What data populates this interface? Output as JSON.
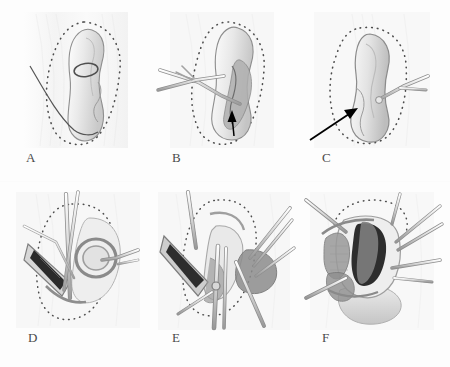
{
  "figure": {
    "type": "surgical-illustration",
    "columns": 3,
    "rows": 2,
    "background_color": "#fdfdfd",
    "line_color": "#5a5a5a",
    "dotted_outline_color": "#4d4d4d",
    "dark_tissue_color": "#1c1c1c",
    "mid_tissue_color": "#8d8d8d",
    "light_tissue_color": "#d6d6d6",
    "arrow_color": "#000000",
    "label_color": "#4a4a4a"
  },
  "panels": [
    {
      "id": "A",
      "label": "A",
      "label_x": 26,
      "label_y": 158,
      "caption": "Organ in situ with dotted resection outline and single suture thread",
      "features": [
        "dotted-outline",
        "organ-body",
        "suture-thread",
        "ligature-loop"
      ],
      "instrument_count": 0,
      "arrow": false
    },
    {
      "id": "B",
      "label": "B",
      "label_x": 172,
      "label_y": 158,
      "caption": "Forceps and scissors introduced; black arrow marks dissection point",
      "features": [
        "dotted-outline",
        "organ-body",
        "forceps",
        "scissors",
        "shaded-hilum"
      ],
      "instrument_count": 2,
      "arrow": true,
      "arrow_direction": "up"
    },
    {
      "id": "C",
      "label": "C",
      "label_x": 322,
      "label_y": 158,
      "caption": "Mobilized organ retracted; long arrow indicates plane of exposure",
      "features": [
        "dotted-outline",
        "organ-body",
        "retractor",
        "long-arrow"
      ],
      "instrument_count": 1,
      "arrow": true,
      "arrow_direction": "up-right"
    },
    {
      "id": "D",
      "label": "D",
      "label_x": 28,
      "label_y": 338,
      "caption": "Deep dissection with retractor exposing dark tissue plane",
      "features": [
        "dotted-outline",
        "retractor-blade",
        "dark-cavity",
        "multiple-instruments",
        "vessel-loops"
      ],
      "instrument_count": 4,
      "arrow": false
    },
    {
      "id": "E",
      "label": "E",
      "label_x": 172,
      "label_y": 338,
      "caption": "Wide exposure with several retractors and clamps in the operative field",
      "features": [
        "dotted-outline",
        "retractor-blade",
        "dark-cavity",
        "multiple-instruments",
        "clamps",
        "gray-tissue-masses"
      ],
      "instrument_count": 7,
      "arrow": false
    },
    {
      "id": "F",
      "label": "F",
      "label_x": 322,
      "label_y": 338,
      "caption": "Final view of the opened cavity with specimen and retained instruments",
      "features": [
        "dotted-outline",
        "open-cavity",
        "dark-tissue",
        "gray-tissue-masses",
        "multiple-instruments"
      ],
      "instrument_count": 6,
      "arrow": false
    }
  ]
}
